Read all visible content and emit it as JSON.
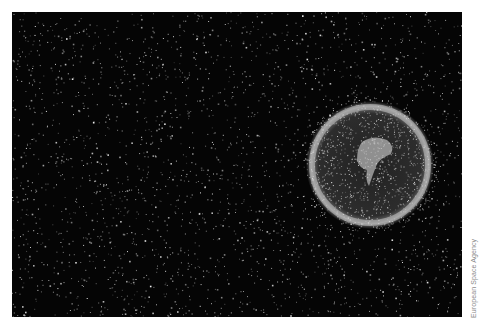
{
  "image": {
    "subject": "Space debris surrounding Earth",
    "background_color": "#050505",
    "debris_color": "#d8d8d8",
    "earth_center": [
      370,
      165
    ],
    "earth_radius": 60
  },
  "credit": {
    "text": "European Space Agency"
  }
}
